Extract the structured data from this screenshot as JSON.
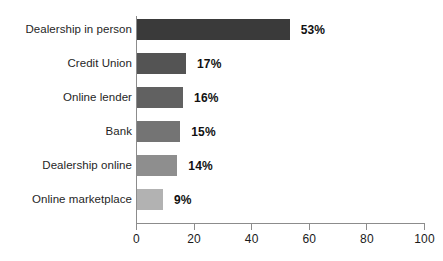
{
  "chart_data": {
    "type": "bar",
    "orientation": "horizontal",
    "title": "",
    "subtitle": "",
    "xlabel": "",
    "ylabel": "",
    "xlim": [
      0,
      100
    ],
    "xticks": [
      0,
      20,
      40,
      60,
      80,
      100
    ],
    "xtick_labels": [
      "0",
      "20",
      "40",
      "60",
      "80",
      "100"
    ],
    "grid": false,
    "legend": null,
    "categories": [
      "Dealership in person",
      "Credit Union",
      "Online lender",
      "Bank",
      "Dealership online",
      "Online marketplace"
    ],
    "values": [
      53,
      17,
      16,
      15,
      14,
      9
    ],
    "value_labels": [
      "53%",
      "17%",
      "16%",
      "15%",
      "14%",
      "9%"
    ],
    "bar_colors": [
      "#3a3a3a",
      "#545454",
      "#616161",
      "#747474",
      "#8e8e8e",
      "#b2b2b2"
    ],
    "axis_color": "#8c8c8c",
    "background_color": "#ffffff"
  }
}
